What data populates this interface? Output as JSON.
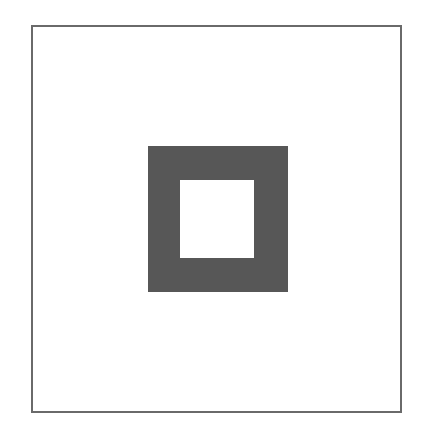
{
  "diagram": {
    "shapes": [
      {
        "type": "rect",
        "role": "frame",
        "stroke": "#6a6a6a",
        "fill": "none"
      },
      {
        "type": "rect",
        "role": "outer-square",
        "fill": "#575757"
      },
      {
        "type": "rect",
        "role": "inner-square",
        "fill": "#ffffff"
      }
    ],
    "colors": {
      "frame_stroke": "#6a6a6a",
      "square_fill": "#575757",
      "background": "#ffffff"
    }
  }
}
